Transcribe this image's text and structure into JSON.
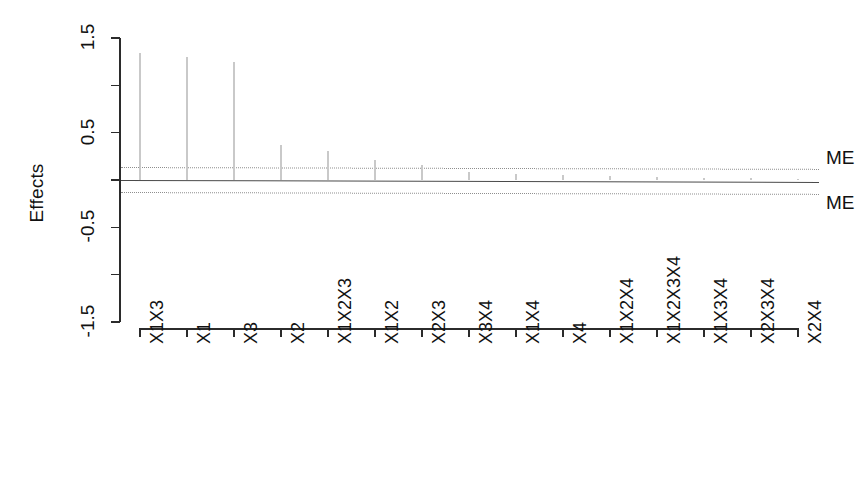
{
  "chart_data": {
    "type": "bar",
    "title": "",
    "subtitle": "",
    "xlabel": "",
    "ylabel": "Effects",
    "categories": [
      "X1X3",
      "X1",
      "X3",
      "X2",
      "X1X2X3",
      "X1X2",
      "X2X3",
      "X3X4",
      "X1X4",
      "X4",
      "X1X2X4",
      "X1X2X3X4",
      "X1X3X4",
      "X2X3X4",
      "X2X4"
    ],
    "values": [
      1.34,
      1.3,
      1.25,
      0.37,
      0.31,
      0.21,
      0.16,
      0.08,
      0.06,
      0.05,
      0.04,
      0.03,
      0.02,
      0.02,
      0.01
    ],
    "ylim": [
      -1.5,
      1.5
    ],
    "yticks": [
      1.5,
      1.0,
      0.5,
      0.0,
      -0.5,
      -1.0,
      -1.5
    ],
    "ytick_labels": [
      "1.5",
      "",
      "0.5",
      "",
      "-0.5",
      "",
      "-1.5"
    ],
    "grid": false,
    "legend": "none",
    "annotations": [
      {
        "name": "ME upper",
        "label": "ME",
        "y_left": 0.135,
        "y_right": 0.115
      },
      {
        "name": "ME lower",
        "label": "ME",
        "y_left": -0.125,
        "y_right": -0.145
      },
      {
        "name": "zero reference",
        "label": "",
        "y_left": 0.005,
        "y_right": -0.015
      }
    ],
    "bar_color": "#c9c9c9",
    "axis_color": "#2b2b2b",
    "me_line_color": "#8e8e8e",
    "zero_line_color": "#4a4a4a"
  },
  "axis": {
    "y_title": "Effects",
    "y_labels": [
      "1.5",
      "0.5",
      "-0.5",
      "-1.5"
    ]
  },
  "annotations": {
    "me_upper_label": "ME",
    "me_lower_label": "ME"
  }
}
